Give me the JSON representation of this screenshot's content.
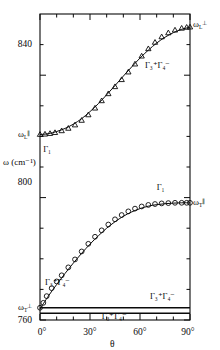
{
  "chart_data": {
    "type": "scatter",
    "title": "",
    "xlabel": "θ",
    "ylabel": "ω (cm⁻¹)",
    "xlim": [
      0,
      90
    ],
    "ylim": [
      760,
      860
    ],
    "grid": false,
    "legend": "none",
    "x_ticks_major": [
      0,
      30,
      60,
      90
    ],
    "x_tick_labels": [
      "0°",
      "30°",
      "60°",
      "90°"
    ],
    "x_ticks_minor": [
      10,
      20,
      40,
      50,
      70,
      80
    ],
    "y_ticks_major": [
      760,
      800,
      840
    ],
    "y_tick_labels": [
      "760",
      "800",
      "840"
    ],
    "y_ticks_minor": [
      770,
      780,
      790,
      810,
      820,
      830,
      850
    ],
    "series": [
      {
        "name": "upper-branch-triangles",
        "marker": "triangle",
        "x": [
          0,
          3,
          6,
          9,
          13,
          17,
          21,
          25,
          29,
          33,
          37,
          41,
          45,
          49,
          53,
          57,
          61,
          65,
          69,
          73,
          77,
          81,
          85,
          88,
          90
        ],
        "y": [
          820.6,
          820.7,
          820.9,
          821.2,
          821.8,
          822.6,
          823.7,
          825.2,
          827.0,
          829.2,
          831.6,
          833.9,
          836.2,
          838.5,
          841.0,
          843.6,
          846.2,
          848.6,
          850.7,
          852.5,
          853.8,
          854.7,
          855.3,
          855.6,
          855.7
        ]
      },
      {
        "name": "lower-branch-circles",
        "marker": "circle",
        "x": [
          0,
          2,
          4,
          7,
          10,
          13,
          17,
          21,
          25,
          29,
          33,
          37,
          41,
          45,
          49,
          53,
          57,
          61,
          65,
          69,
          73,
          77,
          81,
          85,
          88,
          90
        ],
        "y": [
          764.0,
          765.6,
          767.8,
          770.4,
          772.6,
          774.6,
          777.2,
          779.8,
          782.4,
          784.9,
          787.2,
          789.3,
          791.2,
          792.9,
          794.3,
          795.5,
          796.4,
          797.1,
          797.6,
          797.9,
          798.1,
          798.2,
          798.3,
          798.3,
          798.3,
          798.3
        ]
      }
    ],
    "curves": [
      {
        "name": "upper-branch-fit",
        "x": [
          0,
          5,
          10,
          15,
          20,
          25,
          30,
          35,
          40,
          45,
          50,
          55,
          60,
          65,
          70,
          75,
          80,
          85,
          90
        ],
        "y": [
          820.6,
          820.9,
          821.6,
          822.6,
          824.0,
          825.8,
          828.1,
          830.7,
          833.6,
          836.6,
          839.7,
          842.7,
          845.6,
          848.2,
          850.5,
          852.4,
          853.9,
          855.0,
          855.7
        ]
      },
      {
        "name": "lower-branch-fit",
        "x": [
          0,
          5,
          10,
          15,
          20,
          25,
          30,
          35,
          40,
          45,
          50,
          55,
          60,
          65,
          70,
          75,
          80,
          85,
          90
        ],
        "y": [
          763.6,
          767.8,
          771.6,
          775.2,
          778.6,
          781.8,
          784.8,
          787.5,
          790.0,
          792.1,
          793.9,
          795.3,
          796.4,
          797.2,
          797.7,
          798.0,
          798.2,
          798.3,
          798.3
        ]
      }
    ],
    "horizontal_lines": [
      {
        "name": "omega-T-perp-line",
        "y": 764.0
      },
      {
        "name": "lower-flat-line",
        "y": 762.2
      }
    ],
    "annotations": [
      {
        "name": "omega-L-perp",
        "text": "ω",
        "sub": "L",
        "sup": "⊥",
        "x": 92,
        "y": 856.5,
        "placement": "right-outside"
      },
      {
        "name": "omega-L-par",
        "text": "ω",
        "sub": "L",
        "sup": "∥",
        "x": -3,
        "y": 820.6,
        "placement": "left-outside"
      },
      {
        "name": "omega-T-par",
        "text": "ω",
        "sub": "T",
        "sup": "∥",
        "x": 92,
        "y": 798.3,
        "placement": "right-outside"
      },
      {
        "name": "omega-T-perp",
        "text": "ω",
        "sub": "T",
        "sup": "⊥",
        "x": -3,
        "y": 764.0,
        "placement": "left-outside"
      },
      {
        "name": "sym-upper-curve",
        "text": "Γ₃⁺Γ₄⁻",
        "x": 63,
        "y": 843.0
      },
      {
        "name": "sym-gamma1-upper",
        "text": "Γ₁",
        "x": 2,
        "y": 815.5
      },
      {
        "name": "sym-gamma1-lower",
        "text": "Γ₁",
        "x": 70,
        "y": 803.0
      },
      {
        "name": "sym-lower-left",
        "text": "Γ₃⁺Γ₄⁻",
        "x": 3,
        "y": 772.0
      },
      {
        "name": "sym-lower-right",
        "text": "Γ₃⁺Γ₄⁻",
        "x": 66,
        "y": 767.5
      },
      {
        "name": "sym-bottom",
        "text": "Γ₃⁺Γ₄⁻",
        "x": 37,
        "y": 761.0
      }
    ]
  },
  "axes": {
    "y_label": "ω (cm⁻¹)",
    "x_label": "θ",
    "y_ticks": [
      "840",
      "800",
      "760"
    ],
    "x_ticks": [
      "0°",
      "30°",
      "60°",
      "90°"
    ]
  },
  "colors": {
    "ink": "#0a0a0a",
    "background": "#ffffff"
  }
}
